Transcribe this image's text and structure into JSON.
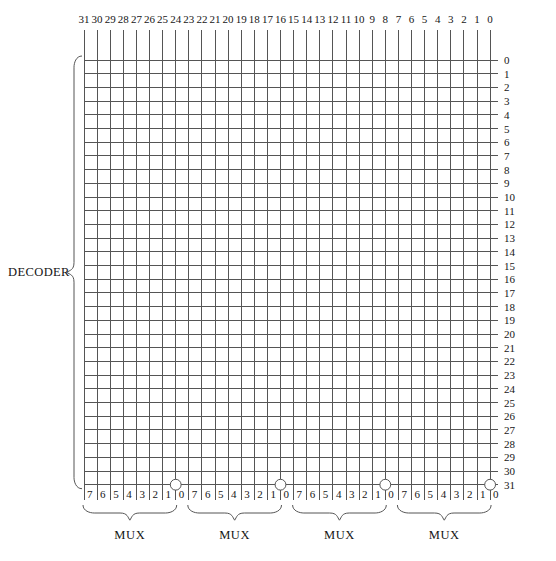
{
  "diagram": {
    "decoder_label": "DECODER",
    "grid": {
      "columns": 32,
      "rows": 32,
      "origin_x": 84,
      "origin_y": 60,
      "col_pitch": 13.1,
      "row_pitch": 13.7,
      "line_color": "#555555",
      "line_width": 1,
      "col_line_top": 30,
      "col_line_bottom": 500
    },
    "column_labels": [
      "31",
      "30",
      "29",
      "28",
      "27",
      "26",
      "25",
      "24",
      "23",
      "22",
      "21",
      "20",
      "19",
      "18",
      "17",
      "16",
      "15",
      "14",
      "13",
      "12",
      "11",
      "10",
      "9",
      "8",
      "7",
      "6",
      "5",
      "4",
      "3",
      "2",
      "1",
      "0"
    ],
    "row_labels": [
      "0",
      "1",
      "2",
      "3",
      "4",
      "5",
      "6",
      "7",
      "8",
      "9",
      "10",
      "11",
      "12",
      "13",
      "14",
      "15",
      "16",
      "17",
      "18",
      "19",
      "20",
      "21",
      "22",
      "23",
      "24",
      "25",
      "26",
      "27",
      "28",
      "29",
      "30",
      "31"
    ],
    "bottom_labels": [
      "7",
      "6",
      "5",
      "4",
      "3",
      "2",
      "1",
      "0",
      "7",
      "6",
      "5",
      "4",
      "3",
      "2",
      "1",
      "0",
      "7",
      "6",
      "5",
      "4",
      "3",
      "2",
      "1",
      "0",
      "7",
      "6",
      "5",
      "4",
      "3",
      "2",
      "1",
      "0"
    ],
    "mux_groups": [
      {
        "label": "MUX",
        "start_col": 0,
        "span": 8
      },
      {
        "label": "MUX",
        "start_col": 8,
        "span": 8
      },
      {
        "label": "MUX",
        "start_col": 16,
        "span": 8
      },
      {
        "label": "MUX",
        "start_col": 24,
        "span": 8
      }
    ],
    "connection_dots": [
      {
        "col": 7,
        "row": 31,
        "radius": 5.4
      },
      {
        "col": 15,
        "row": 31,
        "radius": 5.4
      },
      {
        "col": 23,
        "row": 31,
        "radius": 5.4
      },
      {
        "col": 31,
        "row": 31,
        "radius": 5.4
      }
    ],
    "colors": {
      "line": "#555555",
      "text": "#161616",
      "brace": "#555555",
      "background": "#ffffff"
    }
  }
}
